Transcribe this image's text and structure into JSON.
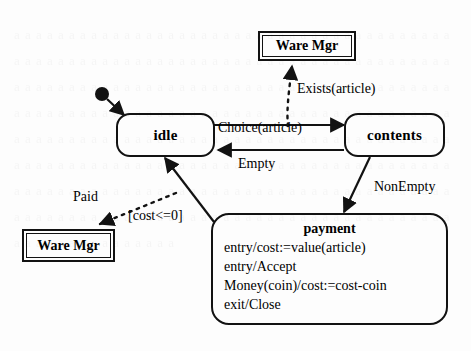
{
  "diagram": {
    "kind": "uml-state-machine-diagram",
    "background_color": "#fdfdfd",
    "line_color": "#121212",
    "noise_text": "a a a a a a a a a a a a a a  a a a a a a a a a a a a a\na a a a a a a a a a a a a a a a a a a a a a a a a a a a\na a a a a a a a a a a a a a a a a a a a a a a a a a a a\na a a a a a a a a a a a a a a a a a a a a a a a a a a a\na a a a a a a a a a a a a a a a a a a a a a a a a a a a\na a a a a a a a a a a a a a a a a a a a a a a a a a a a\na a a a a a a a a a a a a a a a a a a a a a a a a a a a\na a a a a a a a a a a a a a a a a a a a a a a a a a a a\na a a a a a a a a a a a a a a a a a a a a a a a a a a a\na a a a a a a a a a a a a a a a a a a a a a a a a a a a\na a a a a a a a a a a a a a a a a a a a a a a a a a a a\na a a a a a a a a a a a a a a a a a a a a a a a a a a a",
    "states": {
      "idle": {
        "name": "idle"
      },
      "contents": {
        "name": "contents"
      },
      "payment": {
        "name": "payment",
        "lines": [
          "entry/cost:=value(article)",
          "entry/Accept",
          "Money(coin)/cost:=cost-coin",
          "exit/Close"
        ]
      }
    },
    "actors": {
      "ware_mgr_top": {
        "name": "Ware Mgr"
      },
      "ware_mgr_bottom": {
        "name": "Ware Mgr"
      }
    },
    "transitions": {
      "choice": {
        "label": "Choice(article)"
      },
      "empty": {
        "label": "Empty"
      },
      "nonempty": {
        "label": "NonEmpty"
      },
      "exists": {
        "label": "Exists(article)"
      },
      "paid": {
        "label": "Paid"
      },
      "cost_guard": {
        "label": "[cost<=0]"
      }
    },
    "initial_pseudostate": {
      "name": "initial-state"
    }
  }
}
